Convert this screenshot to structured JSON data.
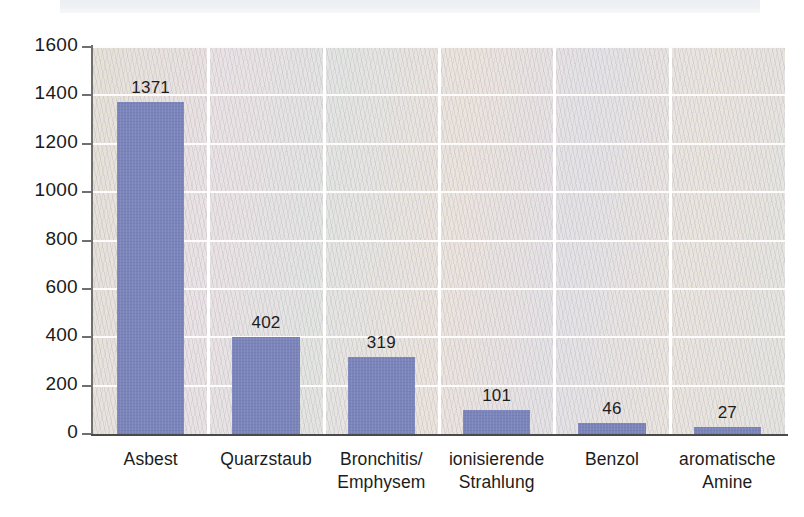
{
  "chart_data": {
    "type": "bar",
    "title": "",
    "subtitle": "",
    "xlabel": "",
    "ylabel": "",
    "categories": [
      "Asbest",
      "Bronchitis/\nEmphysem",
      "Quarzstaub",
      "ionisierende\nStrahlung",
      "Benzol",
      "aromatische\nAmine"
    ],
    "category_lines": [
      [
        "Asbest"
      ],
      [
        "Quarzstaub"
      ],
      [
        "Bronchitis/",
        "Emphysem"
      ],
      [
        "ionisierende",
        "Strahlung"
      ],
      [
        "Benzol"
      ],
      [
        "aromatische",
        "Amine"
      ]
    ],
    "values": [
      1371,
      402,
      319,
      101,
      46,
      27
    ],
    "value_labels": [
      "1371",
      "402",
      "319",
      "101",
      "46",
      "27"
    ],
    "ylim": [
      0,
      1600
    ],
    "ytick_values": [
      1600,
      1400,
      1200,
      1000,
      800,
      600,
      400,
      200,
      0
    ],
    "ytick_labels": [
      "1600",
      "1400",
      "1200",
      "1000",
      "800",
      "600",
      "400",
      "200",
      "0"
    ],
    "grid": "horizontal-and-vertical",
    "legend": "none",
    "bar_color": "#7b85bc",
    "plot_background_color": "#e8e4dd",
    "gridline_color": "#ffffff",
    "axis_color": "#4a4a4a",
    "text_color": "#1a1a1a"
  },
  "figure": {
    "scan_band_label": "scan-artifact-band"
  }
}
